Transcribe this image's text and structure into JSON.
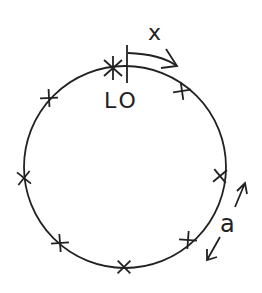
{
  "diagram": {
    "labels": {
      "origin": "LO",
      "direction": "x",
      "spacing": "a"
    },
    "circle": {
      "cx": 125,
      "cy": 167,
      "r": 101
    },
    "marks": [
      {
        "x": 182,
        "y": 91
      },
      {
        "x": 220,
        "y": 176
      },
      {
        "x": 188,
        "y": 240
      },
      {
        "x": 124,
        "y": 267
      },
      {
        "x": 60,
        "y": 243
      },
      {
        "x": 24,
        "y": 178
      },
      {
        "x": 49,
        "y": 98
      }
    ],
    "origin_mark": {
      "x": 113,
      "y": 68
    },
    "stroke_color": "#222222"
  }
}
